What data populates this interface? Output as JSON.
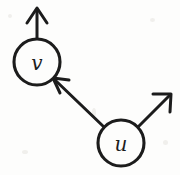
{
  "diagram": {
    "background_color": "#fdfdfc",
    "stroke_color": "#1c1c1c",
    "nodes": [
      {
        "id": "v",
        "label": "v",
        "cx": 37,
        "cy": 62,
        "r": 23
      },
      {
        "id": "u",
        "label": "u",
        "cx": 121,
        "cy": 143,
        "r": 23
      }
    ],
    "edges": [
      {
        "id": "edge-u-to-v",
        "from": "u",
        "to": "v",
        "x1": 104,
        "y1": 127,
        "x2": 54,
        "y2": 79,
        "directed": "true",
        "arrow_at": "v"
      },
      {
        "id": "arrow-v-up",
        "from": "v",
        "to": "outside-top",
        "x1": 37,
        "y1": 39,
        "x2": 37,
        "y2": 9,
        "directed": "true",
        "arrow_at": "outside-top"
      },
      {
        "id": "arrow-u-upright",
        "from": "u",
        "to": "outside-top-right",
        "x1": 138,
        "y1": 127,
        "x2": 170,
        "y2": 95,
        "directed": "true",
        "arrow_at": "outside-top-right"
      }
    ]
  }
}
